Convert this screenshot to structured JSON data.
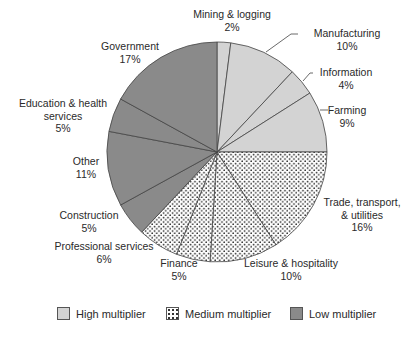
{
  "chart_data": {
    "type": "pie",
    "title": "",
    "start_angle_deg": 0,
    "direction": "clockwise",
    "categories": [
      "Mining & logging",
      "Manufacturing",
      "Information",
      "Farming",
      "Trade, transport, & utilities",
      "Leisure & hospitality",
      "Finance",
      "Professional services",
      "Construction",
      "Other",
      "Education & health services",
      "Government"
    ],
    "values": [
      2,
      10,
      4,
      9,
      16,
      10,
      5,
      6,
      5,
      11,
      5,
      17
    ],
    "units": "%",
    "groups": [
      "High multiplier",
      "High multiplier",
      "High multiplier",
      "High multiplier",
      "Medium multiplier",
      "Medium multiplier",
      "Medium multiplier",
      "Medium multiplier",
      "Low multiplier",
      "Low multiplier",
      "Low multiplier",
      "Low multiplier"
    ],
    "legend": [
      "High multiplier",
      "Medium multiplier",
      "Low multiplier"
    ],
    "legend_position": "bottom"
  },
  "labels": [
    {
      "name": "Mining & logging",
      "pct": "2%"
    },
    {
      "name": "Manufacturing",
      "pct": "10%"
    },
    {
      "name": "Information",
      "pct": "4%"
    },
    {
      "name": "Farming",
      "pct": "9%"
    },
    {
      "name": "Trade, transport,",
      "name2": "& utilities",
      "pct": "16%"
    },
    {
      "name": "Leisure & hospitality",
      "pct": "10%"
    },
    {
      "name": "Finance",
      "pct": "5%"
    },
    {
      "name": "Professional services",
      "pct": "6%"
    },
    {
      "name": "Construction",
      "pct": "5%"
    },
    {
      "name": "Other",
      "pct": "11%"
    },
    {
      "name": "Education & health",
      "name2": "services",
      "pct": "5%"
    },
    {
      "name": "Government",
      "pct": "17%"
    }
  ],
  "legend": {
    "high": "High multiplier",
    "medium": "Medium multiplier",
    "low": "Low multiplier"
  },
  "colors": {
    "high": "#d3d3d3",
    "low": "#8a8a8a",
    "medium_dots": "#333333",
    "outline": "#444444"
  }
}
